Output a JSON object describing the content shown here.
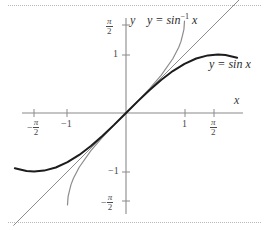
{
  "figure": {
    "background": "#ffffff",
    "rule_color": "#b9b9b9",
    "axis_color": "#8a8a8a"
  },
  "axes": {
    "x_label": "x",
    "y_label": "y",
    "origin_px": [
      126,
      113
    ],
    "unit_px": 58.5,
    "x_ticks": [
      {
        "label_kind": "frac",
        "sign": "−",
        "num": "π",
        "den": "2",
        "value": -1.5708,
        "x_px": 34
      },
      {
        "label_kind": "plain",
        "label": "−1",
        "value": -1,
        "x_px": 67
      },
      {
        "label_kind": "plain",
        "label": "1",
        "value": 1,
        "x_px": 185
      },
      {
        "label_kind": "frac",
        "sign": "",
        "num": "π",
        "den": "2",
        "value": 1.5708,
        "x_px": 214
      }
    ],
    "y_ticks": [
      {
        "label_kind": "frac",
        "sign": "",
        "num": "π",
        "den": "2",
        "value": 1.5708,
        "y_px": 25
      },
      {
        "label_kind": "plain",
        "label": "1",
        "value": 1,
        "y_px": 55
      },
      {
        "label_kind": "plain",
        "label": "−1",
        "value": -1,
        "y_px": 172
      },
      {
        "label_kind": "frac",
        "sign": "−",
        "num": "π",
        "den": "2",
        "value": -1.5708,
        "y_px": 201
      }
    ]
  },
  "chart_data": {
    "type": "line",
    "title": "",
    "xlabel": "x",
    "ylabel": "y",
    "xlim": [
      -1.9,
      2.1
    ],
    "ylim": [
      -1.9,
      1.9
    ],
    "grid": false,
    "legend": "inline-annotations",
    "series": [
      {
        "name": "y = sin x",
        "label_text": "y = sin x",
        "color": "#1c1c1c",
        "width": 2.0,
        "x": [
          -1.9,
          -1.7,
          -1.5708,
          -1.4,
          -1.2,
          -1.0,
          -0.8,
          -0.6,
          -0.4,
          -0.2,
          0.0,
          0.2,
          0.4,
          0.6,
          0.8,
          1.0,
          1.2,
          1.4,
          1.5708,
          1.7,
          1.9
        ],
        "y": [
          -0.946,
          -0.992,
          -1.0,
          -0.985,
          -0.932,
          -0.841,
          -0.717,
          -0.565,
          -0.389,
          -0.199,
          0.0,
          0.199,
          0.389,
          0.565,
          0.717,
          0.841,
          0.932,
          0.985,
          1.0,
          0.992,
          0.946
        ]
      },
      {
        "name": "y = sin^-1 x",
        "label_text": "y = sin⁻¹ x",
        "color": "#8c8c8c",
        "width": 1.2,
        "x": [
          -1.0,
          -0.99,
          -0.97,
          -0.94,
          -0.9,
          -0.8,
          -0.6,
          -0.4,
          -0.2,
          0.0,
          0.2,
          0.4,
          0.6,
          0.8,
          0.9,
          0.94,
          0.97,
          0.99,
          1.0
        ],
        "y": [
          -1.5708,
          -1.4289,
          -1.3453,
          -1.2239,
          -1.1198,
          -0.9273,
          -0.6435,
          -0.4115,
          -0.2014,
          0.0,
          0.2014,
          0.4115,
          0.6435,
          0.9273,
          1.1198,
          1.2239,
          1.3453,
          1.4289,
          1.5708
        ]
      },
      {
        "name": "y = x",
        "label_text": "",
        "color": "#8c8c8c",
        "width": 1.0,
        "x": [
          -1.92,
          2.05
        ],
        "y": [
          -1.92,
          2.05
        ]
      }
    ],
    "annotations": [
      {
        "text": "y = sin⁻¹ x",
        "x_px": 148,
        "y_px": 16
      },
      {
        "text": "y = sin x",
        "x_px": 211,
        "y_px": 60
      },
      {
        "text": "x",
        "x_px": 237,
        "y_px": 98
      },
      {
        "text": "y",
        "x_px": 131,
        "y_px": 16
      }
    ]
  },
  "labels": {
    "y_axis": "y",
    "x_axis": "x",
    "arcsin_prefix": "y = sin",
    "arcsin_exponent": "−1",
    "arcsin_arg": "x",
    "sin_label": "y = sin x",
    "minus_one": "−1",
    "one": "1",
    "pi": "π",
    "two": "2",
    "minus": "−"
  }
}
